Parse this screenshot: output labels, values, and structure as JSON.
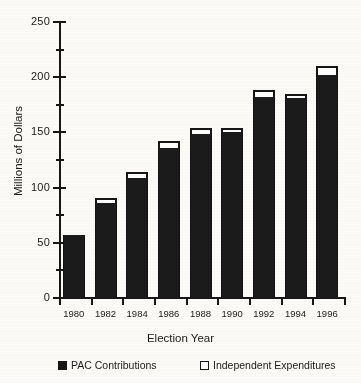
{
  "chart_data": {
    "type": "bar",
    "title": "",
    "subtitle": "",
    "xlabel": "Election Year",
    "ylabel": "Millions of Dollars",
    "categories": [
      "1980",
      "1982",
      "1984",
      "1986",
      "1988",
      "1990",
      "1992",
      "1994",
      "1996"
    ],
    "series": [
      {
        "name": "PAC Contributions",
        "color": "#161616",
        "values": [
          57,
          86,
          109,
          136,
          149,
          150,
          182,
          181,
          202
        ]
      },
      {
        "name": "Independent Expenditures",
        "color": "#ffffff",
        "values": [
          0,
          5,
          5,
          6,
          5,
          4,
          6,
          4,
          8
        ]
      }
    ],
    "totals": [
      57,
      91,
      114,
      142,
      154,
      154,
      188,
      185,
      210
    ],
    "stacked": true,
    "ylim": [
      0,
      250
    ],
    "ytick_values": [
      0,
      50,
      100,
      150,
      200,
      250
    ],
    "ytick_labels": [
      "0",
      "50",
      "100",
      "150",
      "200",
      "250"
    ],
    "yminor_values": [
      25,
      75,
      125,
      175,
      225
    ],
    "grid": false,
    "legend_position": "bottom"
  },
  "axes": {
    "y_title": "Millions of Dollars",
    "x_title": "Election Year"
  },
  "legend": {
    "items": [
      {
        "label": "PAC Contributions",
        "marker": "filled-square"
      },
      {
        "label": "Independent Expenditures",
        "marker": "hollow-square"
      }
    ]
  },
  "colors": {
    "bar_fill": "#1b1b1b",
    "bar_outline": "#161616",
    "cap_fill": "#fdfdfb",
    "background": "#fbfaf7",
    "text": "#1a1a1a"
  }
}
